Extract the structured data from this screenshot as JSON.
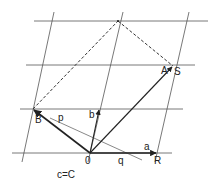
{
  "diagram": {
    "colors": {
      "grid": "#555555",
      "vector": "#222222",
      "dashed": "#333333",
      "background": "#ffffff"
    },
    "labels": {
      "A": "A",
      "S": "S",
      "B": "B",
      "p": "p",
      "b": "b",
      "O": "0",
      "q": "q",
      "a": "a",
      "R": "R",
      "caption": "c=C"
    },
    "points": {
      "O": [
        90,
        153
      ],
      "R": [
        157,
        153
      ],
      "B": [
        33,
        109
      ],
      "S": [
        173,
        66
      ],
      "T": [
        118,
        21
      ],
      "b_tip": [
        99,
        109
      ]
    },
    "grid": {
      "horizontal_y": [
        21,
        65,
        109,
        153
      ],
      "slanted_lines": [
        [
          [
            54,
            12
          ],
          [
            22,
            162
          ]
        ],
        [
          [
            123,
            12
          ],
          [
            88,
            162
          ]
        ],
        [
          [
            189,
            12
          ],
          [
            155,
            162
          ]
        ]
      ]
    }
  }
}
